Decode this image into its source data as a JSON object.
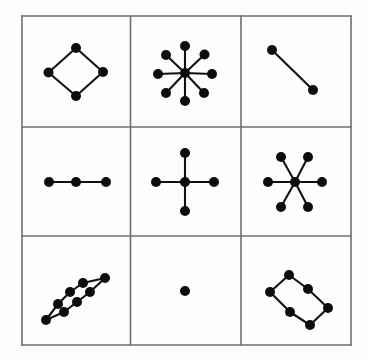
{
  "figure": {
    "title": "",
    "type": "graph-grid-diagram",
    "canvas": {
      "width": 368,
      "height": 360
    },
    "colors": {
      "background": "#fdfdfd",
      "grid_line": "#6f6f6f",
      "node_fill": "#0d0d0d",
      "edge_stroke": "#111111"
    },
    "grid": {
      "rows": 3,
      "cols": 3,
      "x_lines": [
        22,
        130.5,
        241,
        351
      ],
      "y_lines": [
        16,
        127,
        236,
        345
      ],
      "line_width": 1.6
    },
    "node_radius": 5.0,
    "edge_width": 2.1
  },
  "panels": [
    {
      "id": "panel-r1c1",
      "row": 1,
      "col": 1,
      "name": "diamond-cycle-4",
      "label": "4-node diamond cycle",
      "node_count": 4,
      "edge_count": 4,
      "nodes": [
        [
          76,
          48
        ],
        [
          48.5,
          72.5
        ],
        [
          76,
          96
        ],
        [
          103,
          72
        ]
      ],
      "edges": [
        [
          0,
          1
        ],
        [
          1,
          2
        ],
        [
          2,
          3
        ],
        [
          3,
          0
        ]
      ]
    },
    {
      "id": "panel-r1c2",
      "row": 1,
      "col": 2,
      "name": "star-8",
      "label": "8-spoke star with hub",
      "node_count": 9,
      "edge_count": 8,
      "nodes": [
        [
          185,
          73
        ],
        [
          185,
          46
        ],
        [
          204.5,
          54.5
        ],
        [
          212,
          74
        ],
        [
          204,
          93
        ],
        [
          185,
          101
        ],
        [
          166,
          93
        ],
        [
          158,
          74
        ],
        [
          166,
          55
        ]
      ],
      "edges": [
        [
          0,
          1
        ],
        [
          0,
          2
        ],
        [
          0,
          3
        ],
        [
          0,
          4
        ],
        [
          0,
          5
        ],
        [
          0,
          6
        ],
        [
          0,
          7
        ],
        [
          0,
          8
        ]
      ]
    },
    {
      "id": "panel-r1c3",
      "row": 1,
      "col": 3,
      "name": "edge-2",
      "label": "single edge, 2 nodes",
      "node_count": 2,
      "edge_count": 1,
      "nodes": [
        [
          272,
          50
        ],
        [
          313,
          90
        ]
      ],
      "edges": [
        [
          0,
          1
        ]
      ]
    },
    {
      "id": "panel-r2c1",
      "row": 2,
      "col": 1,
      "name": "path-3",
      "label": "horizontal path of 3 nodes",
      "node_count": 3,
      "edge_count": 2,
      "nodes": [
        [
          49,
          182
        ],
        [
          76,
          182
        ],
        [
          106,
          182
        ]
      ],
      "edges": [
        [
          0,
          1
        ],
        [
          1,
          2
        ]
      ]
    },
    {
      "id": "panel-r2c2",
      "row": 2,
      "col": 2,
      "name": "star-4-cross",
      "label": "4-spoke cross star with hub",
      "node_count": 5,
      "edge_count": 4,
      "nodes": [
        [
          185,
          182
        ],
        [
          185,
          153
        ],
        [
          214,
          182
        ],
        [
          185,
          211
        ],
        [
          156,
          182
        ]
      ],
      "edges": [
        [
          0,
          1
        ],
        [
          0,
          2
        ],
        [
          0,
          3
        ],
        [
          0,
          4
        ]
      ]
    },
    {
      "id": "panel-r2c3",
      "row": 2,
      "col": 3,
      "name": "star-6",
      "label": "6-spoke star with hub",
      "node_count": 7,
      "edge_count": 6,
      "nodes": [
        [
          295,
          182
        ],
        [
          322,
          182
        ],
        [
          308,
          157
        ],
        [
          281,
          157
        ],
        [
          268,
          182
        ],
        [
          281,
          207
        ],
        [
          308,
          207
        ]
      ],
      "edges": [
        [
          0,
          1
        ],
        [
          0,
          2
        ],
        [
          0,
          3
        ],
        [
          0,
          4
        ],
        [
          0,
          5
        ],
        [
          0,
          6
        ]
      ]
    },
    {
      "id": "panel-r3c1",
      "row": 3,
      "col": 1,
      "name": "cycle-8-rect",
      "label": "8-node tilted rectangular cycle",
      "node_count": 8,
      "edge_count": 8,
      "nodes": [
        [
          90,
          292
        ],
        [
          77,
          302
        ],
        [
          64,
          312
        ],
        [
          46,
          320
        ],
        [
          58,
          304
        ],
        [
          70,
          292
        ],
        [
          83,
          283
        ],
        [
          105,
          278
        ]
      ],
      "edges": [
        [
          7,
          6
        ],
        [
          6,
          5
        ],
        [
          5,
          4
        ],
        [
          4,
          3
        ],
        [
          3,
          2
        ],
        [
          2,
          1
        ],
        [
          1,
          0
        ],
        [
          0,
          7
        ]
      ]
    },
    {
      "id": "panel-r3c2",
      "row": 3,
      "col": 2,
      "name": "isolated-node",
      "label": "single isolated node",
      "node_count": 1,
      "edge_count": 0,
      "nodes": [
        [
          185,
          291
        ]
      ],
      "edges": []
    },
    {
      "id": "panel-r3c3",
      "row": 3,
      "col": 3,
      "name": "cycle-6-rect",
      "label": "6-node tilted rectangular cycle",
      "node_count": 6,
      "edge_count": 6,
      "nodes": [
        [
          289,
          275
        ],
        [
          270,
          292
        ],
        [
          290,
          312
        ],
        [
          310,
          325
        ],
        [
          328,
          308
        ],
        [
          308,
          289
        ]
      ],
      "edges": [
        [
          0,
          1
        ],
        [
          1,
          2
        ],
        [
          2,
          3
        ],
        [
          3,
          4
        ],
        [
          4,
          5
        ],
        [
          5,
          0
        ]
      ]
    }
  ]
}
